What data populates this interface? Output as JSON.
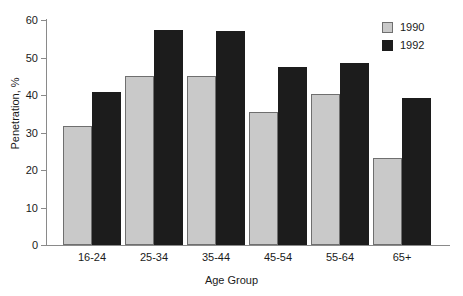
{
  "chart_data": {
    "type": "bar",
    "title": "",
    "subtitle": "",
    "xlabel": "Age Group",
    "ylabel": "Penetration, %",
    "categories": [
      "16-24",
      "25-34",
      "35-44",
      "45-54",
      "55-64",
      "65+"
    ],
    "series": [
      {
        "name": "1990",
        "color": "#c9c9c9",
        "values": [
          31.8,
          45.0,
          45.0,
          35.5,
          40.2,
          23.3
        ]
      },
      {
        "name": "1992",
        "color": "#1c1c1c",
        "values": [
          40.8,
          57.3,
          57.0,
          47.5,
          48.5,
          39.3
        ]
      }
    ],
    "ylim": [
      0,
      60
    ],
    "ytick_values": [
      0,
      10,
      20,
      30,
      40,
      50,
      60
    ],
    "ytick_labels": [
      "0",
      "10",
      "20",
      "30",
      "40",
      "50",
      "60"
    ],
    "grid": false,
    "legend_position": "top-right"
  }
}
